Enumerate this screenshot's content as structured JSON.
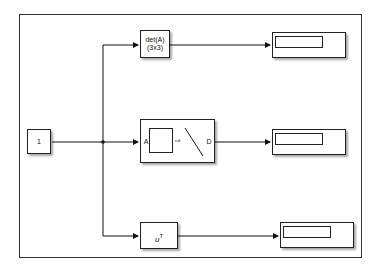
{
  "diagram": {
    "source": {
      "label": "1"
    },
    "blocks": {
      "determinant": {
        "line1": "det(A)",
        "line2": "(3x3)"
      },
      "converter": {
        "input_port": "A",
        "output_port": "D"
      },
      "transpose": {
        "base": "u",
        "sup": "T"
      }
    },
    "displays": [
      {
        "value": ""
      },
      {
        "value": ""
      },
      {
        "value": ""
      }
    ],
    "colors": {
      "line": "#111111",
      "block_border": "#222222",
      "background": "#ffffff"
    }
  }
}
